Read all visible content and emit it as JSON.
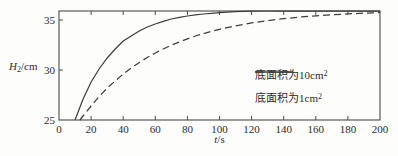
{
  "chart_data": {
    "type": "line",
    "title": "",
    "xlabel": "t/s",
    "ylabel": "H2/cm",
    "xlim": [
      0,
      200
    ],
    "ylim": [
      25,
      36
    ],
    "x_ticks": [
      0,
      20,
      40,
      60,
      80,
      100,
      120,
      140,
      160,
      180,
      200
    ],
    "y_ticks": [
      25,
      30,
      35
    ],
    "grid": false,
    "frame": "box",
    "legend_position": "center-right",
    "series": [
      {
        "name": "底面积为10cm²",
        "style": "dashed",
        "x": [
          13,
          15,
          20,
          25,
          30,
          35,
          40,
          45,
          50,
          55,
          60,
          65,
          70,
          75,
          80,
          85,
          90,
          95,
          100,
          110,
          120,
          130,
          140,
          150,
          160,
          170,
          180,
          190,
          200
        ],
        "y": [
          25,
          25.4,
          26.4,
          27.35,
          28.2,
          28.9,
          29.6,
          30.2,
          30.76,
          31.25,
          31.7,
          32.1,
          32.48,
          32.8,
          33.12,
          33.4,
          33.64,
          33.86,
          34.07,
          34.42,
          34.71,
          34.94,
          35.13,
          35.29,
          35.42,
          35.52,
          35.61,
          35.68,
          35.74
        ]
      },
      {
        "name": "底面积为1cm²",
        "style": "solid",
        "x": [
          10,
          15,
          20,
          25,
          30,
          35,
          40,
          45,
          50,
          55,
          60,
          65,
          70,
          75,
          80,
          85,
          90,
          95,
          100,
          110,
          120,
          130,
          140,
          150,
          160,
          170,
          180,
          190,
          200
        ],
        "y": [
          25,
          27.1,
          28.8,
          30.1,
          31.2,
          32.1,
          32.9,
          33.4,
          33.9,
          34.3,
          34.6,
          34.87,
          35.1,
          35.27,
          35.4,
          35.51,
          35.6,
          35.67,
          35.74,
          35.83,
          35.88,
          35.9,
          35.9,
          35.9,
          35.9,
          35.9,
          35.9,
          35.9,
          35.9
        ]
      }
    ]
  },
  "axes": {
    "y_label": {
      "prefix": "H",
      "sub": "2",
      "suffix": "/cm"
    },
    "x_label": {
      "prefix": "t",
      "suffix": "/s"
    },
    "x_tick_labels": [
      "0",
      "20",
      "40",
      "60",
      "80",
      "100",
      "120",
      "140",
      "160",
      "180",
      "200"
    ],
    "y_tick_labels": [
      "25",
      "30",
      "35"
    ]
  },
  "legend": {
    "items": [
      {
        "label": "底面积为10cm",
        "sup": "2",
        "line": "dashed"
      },
      {
        "label": "底面积为1cm",
        "sup": "2",
        "line": "solid"
      }
    ]
  },
  "colors": {
    "line": "#3f3f3f",
    "frame": "#4a4a4a",
    "text": "#2b2b2b",
    "background": "#fdfdfc"
  }
}
